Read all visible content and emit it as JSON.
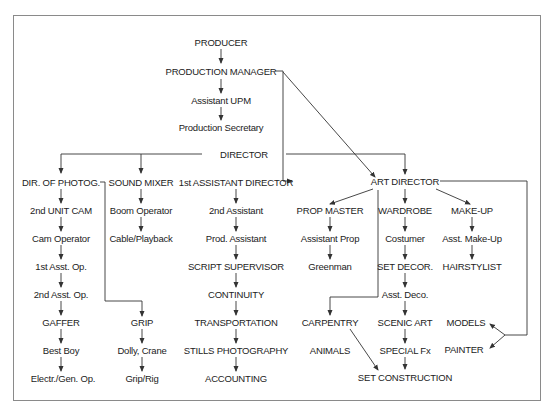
{
  "diagram": {
    "nodes": {
      "producer": "PRODUCER",
      "production_manager": "PRODUCTION MANAGER",
      "assistant_upm": "Assistant UPM",
      "production_secretary": "Production Secretary",
      "director": "DIRECTOR",
      "dir_photog": "DIR. OF PHOTOG.",
      "second_unit_cam": "2nd UNIT CAM",
      "cam_operator": "Cam Operator",
      "first_asst_op": "1st Asst. Op.",
      "second_asst_op": "2nd Asst. Op.",
      "gaffer": "GAFFER",
      "best_boy": "Best Boy",
      "electr_gen_op": "Electr./Gen. Op.",
      "sound_mixer": "SOUND MIXER",
      "boom_operator": "Boom Operator",
      "cable_playback": "Cable/Playback",
      "grip": "GRIP",
      "dolly_crane": "Dolly, Crane",
      "grip_rig": "Grip/Rig",
      "first_ad": "1st ASSISTANT DIRECTOR",
      "second_assistant": "2nd Assistant",
      "prod_assistant": "Prod. Assistant",
      "script_supervisor": "SCRIPT SUPERVISOR",
      "continuity": "CONTINUITY",
      "transportation": "TRANSPORTATION",
      "stills_photography": "STILLS PHOTOGRAPHY",
      "accounting": "ACCOUNTING",
      "art_director": "ART DIRECTOR",
      "prop_master": "PROP MASTER",
      "assistant_prop": "Assistant Prop",
      "greenman": "Greenman",
      "wardrobe": "WARDROBE",
      "costumer": "Costumer",
      "set_decor": "SET DECOR.",
      "asst_deco": "Asst. Deco.",
      "scenic_art": "SCENIC ART",
      "special_fx": "SPECIAL Fx",
      "make_up": "MAKE-UP",
      "asst_make_up": "Asst. Make-Up",
      "hairstylist": "HAIRSTYLIST",
      "carpentry": "CARPENTRY",
      "animals": "ANIMALS",
      "set_construction": "SET CONSTRUCTION",
      "models": "MODELS",
      "painter": "PAINTER"
    },
    "edges": [
      [
        "producer",
        "production_manager"
      ],
      [
        "production_manager",
        "assistant_upm"
      ],
      [
        "assistant_upm",
        "production_secretary"
      ],
      [
        "production_manager",
        "first_ad"
      ],
      [
        "production_manager",
        "art_director"
      ],
      [
        "director",
        "dir_photog"
      ],
      [
        "director",
        "sound_mixer"
      ],
      [
        "director",
        "art_director"
      ],
      [
        "dir_photog",
        "second_unit_cam"
      ],
      [
        "second_unit_cam",
        "cam_operator"
      ],
      [
        "cam_operator",
        "first_asst_op"
      ],
      [
        "first_asst_op",
        "second_asst_op"
      ],
      [
        "second_asst_op",
        "gaffer"
      ],
      [
        "gaffer",
        "best_boy"
      ],
      [
        "best_boy",
        "electr_gen_op"
      ],
      [
        "dir_photog",
        "grip"
      ],
      [
        "grip",
        "dolly_crane"
      ],
      [
        "dolly_crane",
        "grip_rig"
      ],
      [
        "sound_mixer",
        "boom_operator"
      ],
      [
        "boom_operator",
        "cable_playback"
      ],
      [
        "first_ad",
        "second_assistant"
      ],
      [
        "second_assistant",
        "prod_assistant"
      ],
      [
        "prod_assistant",
        "script_supervisor"
      ],
      [
        "script_supervisor",
        "continuity"
      ],
      [
        "continuity",
        "transportation"
      ],
      [
        "transportation",
        "stills_photography"
      ],
      [
        "stills_photography",
        "accounting"
      ],
      [
        "art_director",
        "prop_master"
      ],
      [
        "art_director",
        "wardrobe"
      ],
      [
        "art_director",
        "make_up"
      ],
      [
        "art_director",
        "carpentry"
      ],
      [
        "art_director",
        "models"
      ],
      [
        "art_director",
        "painter"
      ],
      [
        "prop_master",
        "assistant_prop"
      ],
      [
        "assistant_prop",
        "greenman"
      ],
      [
        "wardrobe",
        "costumer"
      ],
      [
        "costumer",
        "set_decor"
      ],
      [
        "set_decor",
        "asst_deco"
      ],
      [
        "asst_deco",
        "scenic_art"
      ],
      [
        "scenic_art",
        "special_fx"
      ],
      [
        "special_fx",
        "set_construction"
      ],
      [
        "carpentry",
        "set_construction"
      ],
      [
        "make_up",
        "asst_make_up"
      ],
      [
        "asst_make_up",
        "hairstylist"
      ]
    ]
  }
}
